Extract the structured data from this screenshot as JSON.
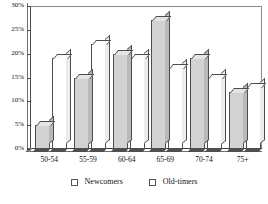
{
  "chart_data": {
    "type": "bar",
    "title": "",
    "subtitle": "",
    "xlabel": "",
    "ylabel": "",
    "categories": [
      "50-54",
      "55-59",
      "60-64",
      "65-69",
      "70-74",
      "75+"
    ],
    "series": [
      {
        "name": "Newcomers",
        "values": [
          5,
          15,
          20,
          27,
          19,
          12
        ]
      },
      {
        "name": "Old-timers",
        "values": [
          19,
          22,
          19,
          17,
          15,
          13
        ]
      }
    ],
    "ylim": [
      0,
      30
    ],
    "ytick_labels": [
      "0%",
      "5%",
      "10%",
      "15%",
      "20%",
      "25%",
      "30%"
    ],
    "ytick_values": [
      0,
      5,
      10,
      15,
      20,
      25,
      30
    ],
    "grid": false,
    "legend_position": "bottom",
    "colors": {
      "newcomers": "#d2d2d2",
      "oldtimers": "#ffffff",
      "outline": "#4d4d4d",
      "axis": "#3c3c3c"
    }
  }
}
